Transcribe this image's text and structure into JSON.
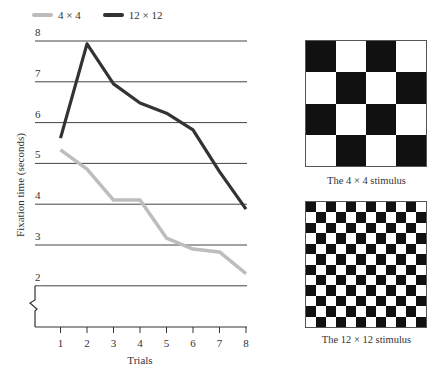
{
  "legend": {
    "items": [
      {
        "label": "4 × 4",
        "color": "#bdbdbd"
      },
      {
        "label": "12 × 12",
        "color": "#333333"
      }
    ]
  },
  "axes": {
    "ylabel": "Fixation time (seconds)",
    "xlabel": "Trials",
    "yticks": [
      "2",
      "3",
      "4",
      "5",
      "6",
      "7",
      "8"
    ],
    "xticks": [
      "1",
      "2",
      "3",
      "4",
      "5",
      "6",
      "7",
      "8"
    ]
  },
  "stimuli": [
    {
      "caption": "The 4 × 4 stimulus",
      "size": 4
    },
    {
      "caption": "The 12 × 12 stimulus",
      "size": 12
    }
  ],
  "chart_data": {
    "type": "line",
    "title": "",
    "xlabel": "Trials",
    "ylabel": "Fixation time (seconds)",
    "categories": [
      1,
      2,
      3,
      4,
      5,
      6,
      7,
      8
    ],
    "x": [
      1,
      2,
      3,
      4,
      5,
      6,
      7,
      8
    ],
    "series": [
      {
        "name": "4 × 4",
        "color": "#bdbdbd",
        "values": [
          5.33,
          4.86,
          4.1,
          4.1,
          3.17,
          2.9,
          2.83,
          2.3
        ]
      },
      {
        "name": "12 × 12",
        "color": "#333333",
        "values": [
          5.62,
          7.93,
          6.95,
          6.48,
          6.23,
          5.82,
          4.8,
          3.88
        ]
      }
    ],
    "ylim": [
      0,
      8
    ],
    "yticks_shown": [
      2,
      3,
      4,
      5,
      6,
      7,
      8
    ],
    "axis_break": "between 0 and 2",
    "grid": true,
    "legend_position": "top-left",
    "annotations": [
      "The 4 × 4 stimulus",
      "The 12 × 12 stimulus"
    ]
  }
}
